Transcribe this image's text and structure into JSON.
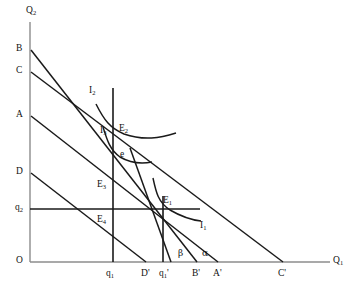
{
  "figure": {
    "type": "economics-indifference-curve-diagram",
    "axes": {
      "y_axis_label": "Q",
      "y_axis_sub": "2",
      "x_axis_label": "Q",
      "x_axis_sub": "1",
      "origin_label": "O"
    },
    "y_intercepts": [
      {
        "label": "B",
        "sub": "",
        "y": 50
      },
      {
        "label": "C",
        "sub": "",
        "y": 72
      },
      {
        "label": "A",
        "sub": "",
        "y": 116
      },
      {
        "label": "D",
        "sub": "",
        "y": 173
      },
      {
        "label": "q",
        "sub": "2",
        "y": 209
      }
    ],
    "x_intercepts": [
      {
        "label": "q",
        "sub": "1",
        "prime": "",
        "x": 110
      },
      {
        "label": "D",
        "sub": "",
        "prime": "'",
        "x": 146
      },
      {
        "label": "q",
        "sub": "1",
        "prime": "'",
        "x": 163
      },
      {
        "label": "B",
        "sub": "",
        "prime": "'",
        "x": 197
      },
      {
        "label": "A",
        "sub": "",
        "prime": "'",
        "x": 218
      },
      {
        "label": "C",
        "sub": "",
        "prime": "'",
        "x": 283
      }
    ],
    "equilibrium_points": [
      {
        "label": "E",
        "sub": "1",
        "x": 163,
        "y": 209
      },
      {
        "label": "E",
        "sub": "2",
        "x": 113,
        "y": 131
      },
      {
        "label": "E",
        "sub": "3",
        "x": 113,
        "y": 186
      },
      {
        "label": "E",
        "sub": "4",
        "x": 113,
        "y": 222
      },
      {
        "label": "e",
        "sub": "",
        "x": 113,
        "y": 156
      }
    ],
    "indifference_curves": [
      {
        "label": "I",
        "sub": "1"
      },
      {
        "label": "I",
        "sub": "2"
      },
      {
        "label": "I",
        "sub": "3"
      }
    ],
    "angles": [
      {
        "label": "β",
        "name": "beta"
      },
      {
        "label": "α",
        "name": "alpha"
      }
    ],
    "colors": {
      "axis": "#8c8c8c",
      "line": "#1a1a1a",
      "text": "#111111",
      "background": "#ffffff"
    }
  }
}
